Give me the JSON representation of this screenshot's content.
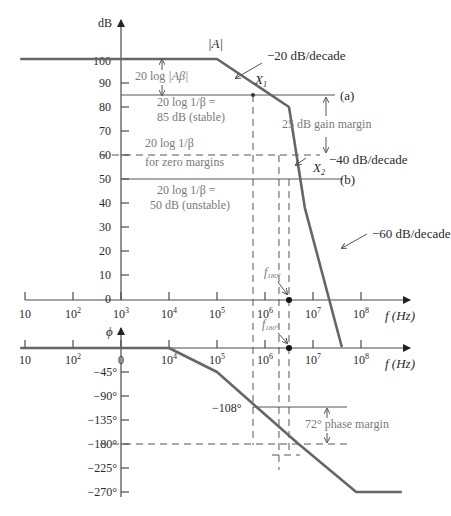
{
  "figure": {
    "gain_axis_label": "dB",
    "phase_axis_label": "ϕ",
    "freq_axis_label": "f (Hz)",
    "gain_ticks": [
      "100",
      "90",
      "80",
      "70",
      "60",
      "50",
      "40",
      "30",
      "20",
      "10",
      "0"
    ],
    "gain_tick_values": [
      100,
      90,
      80,
      70,
      60,
      50,
      40,
      30,
      20,
      10,
      0
    ],
    "phase_ticks": [
      "0",
      "−45°",
      "−90°",
      "−135°",
      "−180°",
      "−225°",
      "−270°"
    ],
    "phase_tick_values": [
      0,
      -45,
      -90,
      -135,
      -180,
      -225,
      -270
    ],
    "freq_ticks_gain": [
      "10",
      "10^2",
      "10^3",
      "10^4",
      "10^5",
      "10^6",
      "10^7",
      "10^8"
    ],
    "freq_ticks_phase": [
      "10",
      "10^2",
      "0",
      "10^4",
      "10^5",
      "10^6",
      "10^7",
      "10^8"
    ],
    "freq_exponents": [
      1,
      2,
      3,
      4,
      5,
      6,
      7,
      8
    ],
    "annotations": {
      "A_label": "|A|",
      "slope20": "−20 dB/decade",
      "slope40": "−40 dB/decade",
      "slope60": "−60 dB/decade",
      "X1": "X",
      "X1_sub": "1",
      "X2": "X",
      "X2_sub": "2",
      "line_a": "(a)",
      "line_b": "(b)",
      "loopgain_pre": "20 log ",
      "loopgain_abs": "|Aβ|",
      "stable_l1": "20 log 1/β =",
      "stable_l2": "85 dB (stable)",
      "zero_l1": "20 log 1/β",
      "zero_l2": "for zero margins",
      "unstable_l1": "20 log 1/β =",
      "unstable_l2": "50 dB (unstable)",
      "gain_margin": "25 dB gain margin",
      "f180": "f",
      "f180_sub": "180°",
      "phase_108": "−108°",
      "phase_margin": "72° phase margin"
    },
    "gain_curve": {
      "log_f": [
        0.9,
        5.0,
        6.5,
        6.83,
        7.6
      ],
      "dB": [
        100,
        100,
        80,
        38,
        -20
      ]
    },
    "phase_curve": {
      "log_f": [
        0.9,
        4.0,
        5.0,
        6.7,
        7.3,
        7.9,
        8.85
      ],
      "deg": [
        0,
        0,
        -45,
        -180,
        -225,
        -270,
        -270
      ]
    },
    "levels": {
      "a_dB": 85,
      "zero_dB": 60,
      "b_dB": 50,
      "phase_108": -108,
      "phase_180": -180
    },
    "markers": {
      "X1_logf": 5.75,
      "X2_logf": 6.5,
      "f180_logf": 6.5,
      "zero_logf": 6.27
    }
  }
}
